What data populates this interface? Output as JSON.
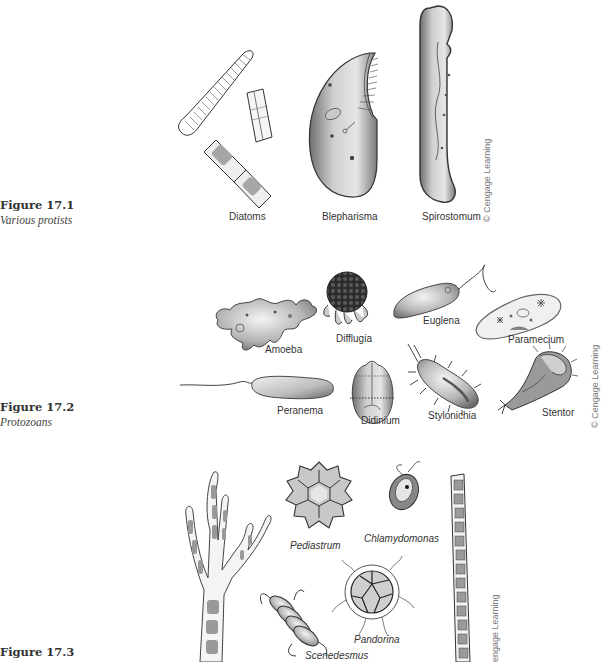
{
  "figures": [
    {
      "number": "Figure 17.1",
      "title": "Various protists",
      "labels": [
        "Diatoms",
        "Blepharisma",
        "Spirostomum"
      ],
      "credit": "© Cengage Learning"
    },
    {
      "number": "Figure 17.2",
      "title": "Protozoans",
      "labels": [
        "Amoeba",
        "Difflugia",
        "Euglena",
        "Paramecium",
        "Peranema",
        "Didinium",
        "Stylonichia",
        "Stentor"
      ],
      "credit": "© Cengage Learning"
    },
    {
      "number": "Figure 17.3",
      "title": "",
      "labels": [
        "Pediastrum",
        "Chlamydomonas",
        "Pandorina",
        "Scenedesmus"
      ],
      "credit": "engage Learning"
    }
  ],
  "colors": {
    "ink": "#333333",
    "fill_light": "#d9d9d9",
    "fill_mid": "#a8a8a8",
    "fill_dark": "#6e6e6e",
    "credit_text": "#777777"
  }
}
